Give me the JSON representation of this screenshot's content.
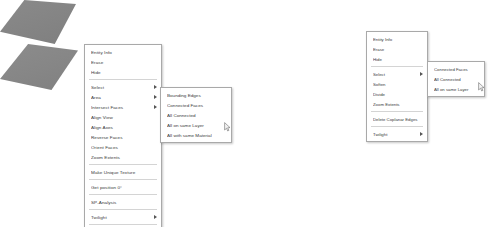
{
  "canvas": {
    "width": 491,
    "height": 227,
    "background_color": "#ffffff",
    "face_color": "#878787"
  },
  "left_capture": {
    "face_name": "sketchup-face-quad",
    "menu": {
      "title": "SketchUp context menu",
      "items": [
        {
          "label": "Entity Info",
          "submenu": false,
          "separator_after": false
        },
        {
          "label": "Erase",
          "submenu": false,
          "separator_after": false
        },
        {
          "label": "Hide",
          "submenu": false,
          "separator_after": true
        },
        {
          "label": "Select",
          "submenu": true,
          "separator_after": false
        },
        {
          "label": "Area",
          "submenu": true,
          "separator_after": false
        },
        {
          "label": "Intersect Faces",
          "submenu": true,
          "separator_after": false
        },
        {
          "label": "Align View",
          "submenu": false,
          "separator_after": false
        },
        {
          "label": "Align Axes",
          "submenu": false,
          "separator_after": false
        },
        {
          "label": "Reverse Faces",
          "submenu": false,
          "separator_after": false
        },
        {
          "label": "Orient Faces",
          "submenu": false,
          "separator_after": false
        },
        {
          "label": "Zoom Extents",
          "submenu": false,
          "separator_after": true
        },
        {
          "label": "Make Unique Texture",
          "submenu": false,
          "separator_after": true
        },
        {
          "label": "Get position 0°",
          "submenu": false,
          "separator_after": true
        },
        {
          "label": "SP-Analysis",
          "submenu": false,
          "separator_after": true
        },
        {
          "label": "Twilight",
          "submenu": true,
          "separator_after": true
        },
        {
          "label": "Add Photo Texture",
          "submenu": false,
          "separator_after": false
        }
      ]
    },
    "submenu": {
      "parent": "Select",
      "items": [
        {
          "label": "Bounding Edges"
        },
        {
          "label": "Connected Faces"
        },
        {
          "label": "All Connected"
        },
        {
          "label": "All on same Layer"
        },
        {
          "label": "All with same Material"
        }
      ]
    }
  },
  "right_capture": {
    "face_name": "sketchup-face-quad",
    "menu": {
      "title": "SketchUp context menu",
      "items": [
        {
          "label": "Entity Info",
          "submenu": false,
          "separator_after": false
        },
        {
          "label": "Erase",
          "submenu": false,
          "separator_after": false
        },
        {
          "label": "Hide",
          "submenu": false,
          "separator_after": true
        },
        {
          "label": "Select",
          "submenu": true,
          "separator_after": false
        },
        {
          "label": "Soften",
          "submenu": false,
          "separator_after": false
        },
        {
          "label": "Divide",
          "submenu": false,
          "separator_after": false
        },
        {
          "label": "Zoom Extents",
          "submenu": false,
          "separator_after": true
        },
        {
          "label": "Delete Coplanar Edges",
          "submenu": false,
          "separator_after": true
        },
        {
          "label": "Twilight",
          "submenu": true,
          "separator_after": false
        }
      ]
    },
    "submenu": {
      "parent": "Select",
      "items": [
        {
          "label": "Connected Faces"
        },
        {
          "label": "All Connected"
        },
        {
          "label": "All on same Layer"
        }
      ]
    }
  },
  "caption": {
    "text": ""
  }
}
